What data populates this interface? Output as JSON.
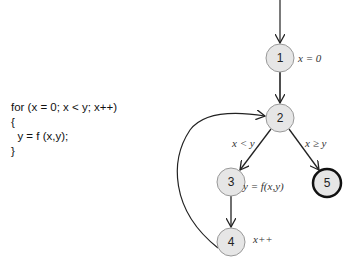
{
  "code": {
    "lines": [
      "for (x = 0; x < y; x++)",
      "{",
      "  y = f (x,y);",
      "}"
    ]
  },
  "graph": {
    "nodes": [
      {
        "id": "1",
        "label": "1",
        "annotation": "x = 0",
        "final": false
      },
      {
        "id": "2",
        "label": "2",
        "annotation": "",
        "final": false
      },
      {
        "id": "3",
        "label": "3",
        "annotation": "y = f(x,y)",
        "final": false
      },
      {
        "id": "4",
        "label": "4",
        "annotation": "x++",
        "final": false
      },
      {
        "id": "5",
        "label": "5",
        "annotation": "",
        "final": true
      }
    ],
    "edges": [
      {
        "from": "entry",
        "to": "1",
        "label": ""
      },
      {
        "from": "1",
        "to": "2",
        "label": ""
      },
      {
        "from": "2",
        "to": "3",
        "label": "x < y"
      },
      {
        "from": "2",
        "to": "5",
        "label": "x ≥ y"
      },
      {
        "from": "3",
        "to": "4",
        "label": ""
      },
      {
        "from": "4",
        "to": "2",
        "label": ""
      }
    ]
  },
  "colors": {
    "node_fill": "#e6e6e6",
    "node_stroke": "#888888",
    "final_stroke": "#111111",
    "edge": "#222222"
  }
}
